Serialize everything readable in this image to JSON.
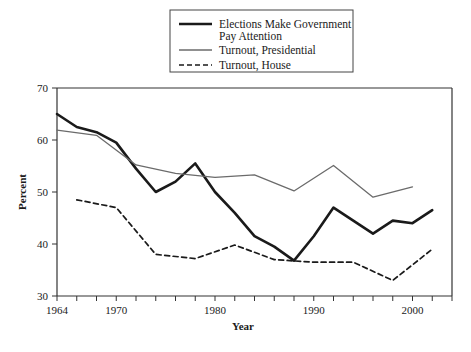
{
  "chart_data": {
    "type": "line",
    "title": "",
    "xlabel": "Year",
    "ylabel": "Percent",
    "xlim": [
      1964,
      2004
    ],
    "ylim": [
      30,
      70
    ],
    "yticks": [
      30,
      40,
      50,
      60,
      70
    ],
    "ytick_labels": [
      "30",
      "40",
      "50",
      "60",
      "70"
    ],
    "xticks": [
      1964,
      1966,
      1968,
      1970,
      1972,
      1974,
      1976,
      1978,
      1980,
      1982,
      1984,
      1986,
      1988,
      1990,
      1992,
      1994,
      1996,
      1998,
      2000,
      2002,
      2004
    ],
    "xtick_labels_shown": [
      "1964",
      "1970",
      "1980",
      "1990",
      "2000"
    ],
    "xtick_labels_positions": [
      1964,
      1970,
      1980,
      1990,
      2000
    ],
    "grid": false,
    "legend_position": "top-center",
    "series": [
      {
        "name": "Elections Make Government Pay Attention",
        "style": "solid-thick",
        "color": "#1a1a1a",
        "x": [
          1964,
          1966,
          1968,
          1970,
          1972,
          1974,
          1976,
          1978,
          1980,
          1982,
          1984,
          1986,
          1988,
          1990,
          1992,
          1994,
          1996,
          1998,
          2000,
          2002
        ],
        "values": [
          65.0,
          62.5,
          61.5,
          59.5,
          54.5,
          50.0,
          52.0,
          55.5,
          50.0,
          46.0,
          41.5,
          39.5,
          36.8,
          41.5,
          47.0,
          44.5,
          42.0,
          44.5,
          44.0,
          46.5
        ]
      },
      {
        "name": "Turnout, Presidential",
        "style": "solid-thin",
        "color": "#6b6b6b",
        "x": [
          1964,
          1968,
          1972,
          1976,
          1980,
          1984,
          1988,
          1992,
          1996,
          2000
        ],
        "values": [
          61.9,
          60.9,
          55.2,
          53.6,
          52.8,
          53.3,
          50.2,
          55.1,
          49.0,
          51.0
        ]
      },
      {
        "name": "Turnout, House",
        "style": "dashed",
        "color": "#1a1a1a",
        "x": [
          1966,
          1970,
          1974,
          1978,
          1982,
          1986,
          1990,
          1994,
          1998,
          2002
        ],
        "values": [
          48.5,
          47.0,
          38.0,
          37.2,
          39.8,
          37.0,
          36.5,
          36.5,
          33.0,
          39.0
        ]
      }
    ]
  },
  "legend": {
    "entries": [
      {
        "label_line1": "Elections Make Government",
        "label_line2": "Pay Attention",
        "style": "solid-thick"
      },
      {
        "label_line1": "Turnout, Presidential",
        "label_line2": "",
        "style": "solid-thin"
      },
      {
        "label_line1": "Turnout, House",
        "label_line2": "",
        "style": "dashed"
      }
    ]
  },
  "axes": {
    "x_title": "Year",
    "y_title": "Percent"
  }
}
